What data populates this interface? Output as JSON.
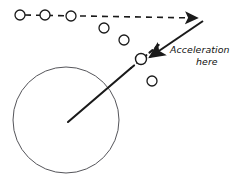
{
  "figure": {
    "kind": "physics-motion-diagram",
    "background_color": "#ffffff",
    "stroke_color": "#1a1a1a",
    "body_outline_color": "#55555a",
    "width": 241,
    "height": 188
  },
  "annotations": {
    "acceleration_label_line1": "Acceleration",
    "acceleration_label_line2": "here"
  },
  "large_body": {
    "name": "planet-circle",
    "center_x": 66,
    "center_y": 120,
    "radius": 53,
    "stroke_width": 1
  },
  "trajectory_markers": [
    {
      "label": "position-1",
      "cx": 20,
      "cy": 15,
      "r": 5
    },
    {
      "label": "position-2",
      "cx": 45,
      "cy": 15,
      "r": 5
    },
    {
      "label": "position-3",
      "cx": 71,
      "cy": 16,
      "r": 5
    },
    {
      "label": "position-4",
      "cx": 104,
      "cy": 28,
      "r": 5
    },
    {
      "label": "position-5",
      "cx": 124,
      "cy": 40,
      "r": 5
    },
    {
      "label": "position-6",
      "cx": 141,
      "cy": 59,
      "r": 5.5
    },
    {
      "label": "position-7",
      "cx": 152,
      "cy": 81,
      "r": 5
    }
  ],
  "dashed_path": {
    "name": "inertial-straight-path",
    "points": [
      [
        25,
        15
      ],
      [
        200,
        18
      ]
    ],
    "dash_pattern": "6 5",
    "stroke_width": 1.6,
    "arrow": true
  },
  "radial_line": {
    "name": "gravity-radius-line",
    "solid_points": [
      [
        68,
        122
      ],
      [
        131,
        68
      ]
    ],
    "dashed_points": [
      [
        131,
        68
      ],
      [
        160,
        44
      ]
    ],
    "dash_pattern": "4 4",
    "stroke_width": 2.1
  },
  "acceleration_arrow": {
    "name": "acceleration-vector",
    "tail": [
      203,
      21
    ],
    "head": [
      147,
      59
    ],
    "stroke_width": 2.1,
    "arrow": true
  }
}
